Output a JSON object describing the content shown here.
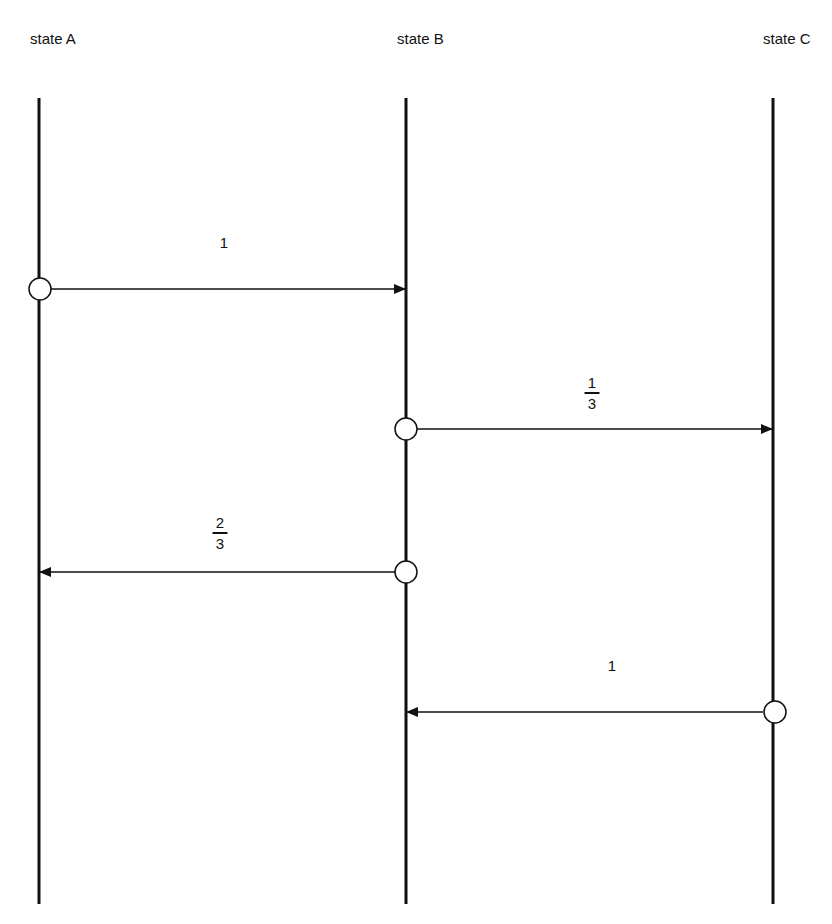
{
  "states": [
    {
      "id": "A",
      "label": "state A"
    },
    {
      "id": "B",
      "label": "state B"
    },
    {
      "id": "C",
      "label": "state C"
    }
  ],
  "transitions": [
    {
      "from": "A",
      "to": "B",
      "label": "1",
      "numerator": null,
      "denominator": null
    },
    {
      "from": "B",
      "to": "C",
      "label": "1/3",
      "numerator": "1",
      "denominator": "3"
    },
    {
      "from": "B",
      "to": "A",
      "label": "2/3",
      "numerator": "2",
      "denominator": "3"
    },
    {
      "from": "C",
      "to": "B",
      "label": "1",
      "numerator": null,
      "denominator": null
    }
  ]
}
